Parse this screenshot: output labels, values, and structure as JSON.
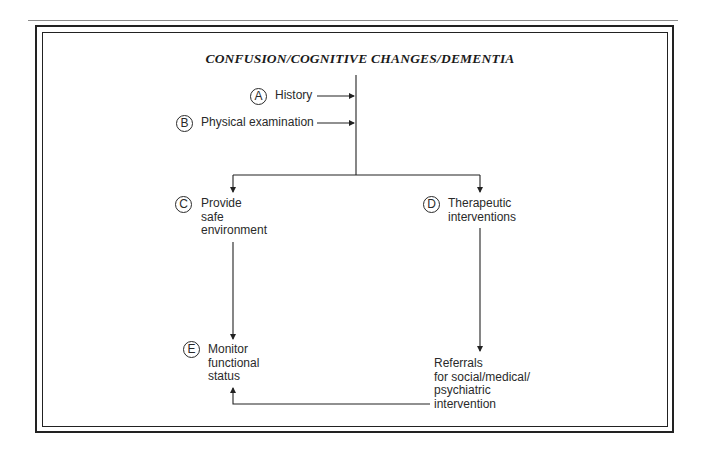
{
  "title": "CONFUSION/COGNITIVE CHANGES/DEMENTIA",
  "nodes": {
    "a": {
      "letter": "A",
      "label": "History"
    },
    "b": {
      "letter": "B",
      "label": "Physical examination"
    },
    "c": {
      "letter": "C",
      "label": "Provide\nsafe\nenvironment"
    },
    "d": {
      "letter": "D",
      "label": "Therapeutic\ninterventions"
    },
    "e": {
      "letter": "E",
      "label": "Monitor\nfunctional\nstatus"
    },
    "referrals": {
      "label": "Referrals\nfor social/medical/\npsychiatric\nintervention"
    }
  },
  "edges": [
    {
      "from": "A",
      "to": "main-trunk"
    },
    {
      "from": "B",
      "to": "main-trunk"
    },
    {
      "from": "main-trunk",
      "to": "C"
    },
    {
      "from": "main-trunk",
      "to": "D"
    },
    {
      "from": "C",
      "to": "E"
    },
    {
      "from": "D",
      "to": "Referrals"
    },
    {
      "from": "Referrals",
      "to": "E"
    }
  ],
  "colors": {
    "line": "#222222",
    "rule": "#8a8a8a"
  }
}
